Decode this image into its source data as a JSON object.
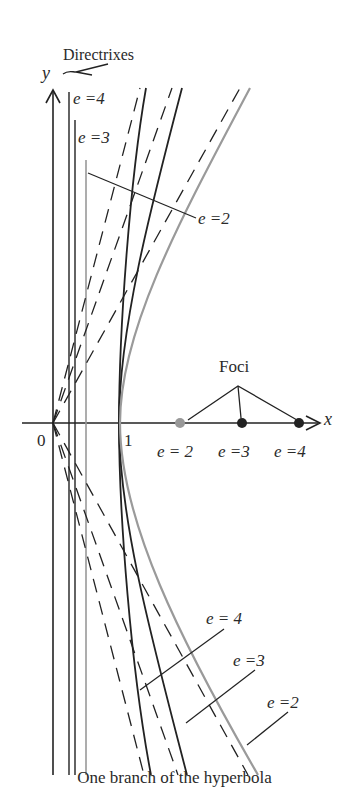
{
  "figure": {
    "caption": "One branch of the hyperbola",
    "axes": {
      "x_label": "x",
      "y_label": "y",
      "origin_label": "0",
      "vertex_label": "1"
    },
    "annotations": {
      "directrixes": "Directrixes",
      "foci": "Foci"
    },
    "directrix_labels": [
      {
        "e": 4,
        "text": "e =4"
      },
      {
        "e": 3,
        "text": "e =3"
      }
    ],
    "curve_labels_top": [
      {
        "e": 2,
        "text": "e =2"
      }
    ],
    "focus_labels": [
      {
        "e": 2,
        "text": "e = 2"
      },
      {
        "e": 3,
        "text": "e =3"
      },
      {
        "e": 4,
        "text": "e =4"
      }
    ],
    "curve_labels_bottom": [
      {
        "e": 4,
        "text": "e = 4"
      },
      {
        "e": 3,
        "text": "e =3"
      },
      {
        "e": 2,
        "text": "e =2"
      }
    ],
    "hyperbolas": [
      {
        "e": 2,
        "vertex": 1,
        "focus": 2,
        "directrix": 0.5,
        "asymptote_slope": 1.732,
        "color": "#9a9a9a"
      },
      {
        "e": 3,
        "vertex": 1,
        "focus": 3,
        "directrix": 0.333,
        "asymptote_slope": 2.828,
        "color": "#222222"
      },
      {
        "e": 4,
        "vertex": 1,
        "focus": 4,
        "directrix": 0.25,
        "asymptote_slope": 3.873,
        "color": "#222222"
      }
    ],
    "colors": {
      "ink": "#222222",
      "gray": "#9a9a9a"
    }
  }
}
